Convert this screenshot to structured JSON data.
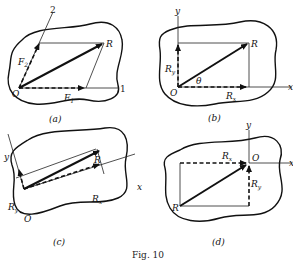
{
  "figure": {
    "caption": "Fig. 10",
    "panels": [
      {
        "id": "a",
        "label": "(a)",
        "origin": "O",
        "resultant": "R",
        "components": [
          "F1",
          "F2"
        ],
        "axes": [
          "1",
          "2"
        ],
        "text": {
          "O": "O",
          "R": "R",
          "F1": "F",
          "F1_sub": "1",
          "F2": "F",
          "F2_sub": "2",
          "axis1": "1",
          "axis2": "2"
        }
      },
      {
        "id": "b",
        "label": "(b)",
        "origin": "O",
        "resultant": "R",
        "components": [
          "Rx",
          "Ry"
        ],
        "axes": [
          "x",
          "y"
        ],
        "angle": "θ",
        "text": {
          "O": "O",
          "R": "R",
          "Rx": "R",
          "Rx_sub": "x",
          "Ry": "R",
          "Ry_sub": "y",
          "x": "x",
          "y": "y",
          "theta": "θ"
        }
      },
      {
        "id": "c",
        "label": "(c)",
        "origin": "O",
        "resultant": "R",
        "components": [
          "Rx",
          "Ry"
        ],
        "axes": [
          "x",
          "y"
        ],
        "text": {
          "O": "O",
          "R": "R",
          "Rx": "R",
          "Rx_sub": "x",
          "Ry": "R",
          "Ry_sub": "y",
          "x": "x",
          "y": "y"
        }
      },
      {
        "id": "d",
        "label": "(d)",
        "origin": "O",
        "resultant": "R",
        "components": [
          "Rx",
          "Ry"
        ],
        "axes": [
          "x",
          "y"
        ],
        "text": {
          "O": "O",
          "R": "R",
          "Rx": "R",
          "Rx_sub": "x",
          "Ry": "R",
          "Ry_sub": "y",
          "x": "x",
          "y": "y"
        }
      }
    ]
  }
}
